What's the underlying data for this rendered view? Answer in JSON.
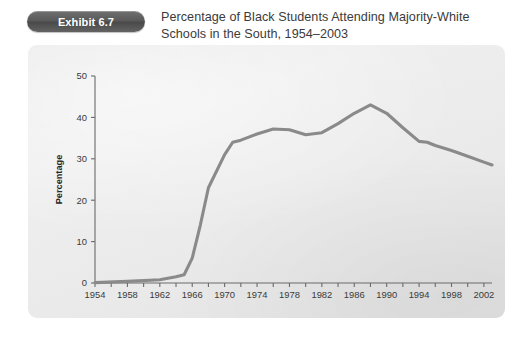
{
  "exhibit": {
    "badge_label": "Exhibit 6.7",
    "title_line1": "Percentage of Black Students Attending Majority-White",
    "title_line2": "Schools in the South, 1954–2003"
  },
  "colors": {
    "badge_bg": "#5a5a5a",
    "badge_text": "#ffffff",
    "panel_bg": "#e9e9e9",
    "line": "#8a8a8a",
    "axis": "#6a6a6a",
    "title_text": "#3b3b3b",
    "tick_text": "#3a3a3a",
    "page_bg": "#ffffff"
  },
  "chart_data": {
    "type": "line",
    "title": "Percentage of Black Students Attending Majority-White Schools in the South, 1954–2003",
    "xlabel": "",
    "ylabel": "Percentage",
    "xlim": [
      1954,
      2003
    ],
    "ylim": [
      0,
      50
    ],
    "grid": false,
    "legend": null,
    "ytick_labels": [
      "0",
      "10",
      "20",
      "30",
      "40",
      "50"
    ],
    "ytick_values": [
      0,
      10,
      20,
      30,
      40,
      50
    ],
    "xtick_labels": [
      "1954",
      "1958",
      "1962",
      "1966",
      "1970",
      "1974",
      "1978",
      "1982",
      "1986",
      "1990",
      "1994",
      "1998",
      "2002"
    ],
    "xtick_values": [
      1954,
      1958,
      1962,
      1966,
      1970,
      1974,
      1978,
      1982,
      1986,
      1990,
      1994,
      1998,
      2002
    ],
    "xminor_step": 2,
    "series": [
      {
        "name": "Percentage of Black students in majority-white schools",
        "color": "#8a8a8a",
        "x": [
          1954,
          1958,
          1962,
          1964,
          1965,
          1966,
          1967,
          1968,
          1970,
          1971,
          1972,
          1974,
          1976,
          1978,
          1980,
          1982,
          1984,
          1986,
          1988,
          1990,
          1992,
          1994,
          1995,
          1996,
          1998,
          2000,
          2002,
          2003
        ],
        "y": [
          0.1,
          0.4,
          0.8,
          1.5,
          2.0,
          6.0,
          14.0,
          23.0,
          31.0,
          34.0,
          34.5,
          36.0,
          37.2,
          37.0,
          35.8,
          36.3,
          38.5,
          41.0,
          43.0,
          41.0,
          37.5,
          34.2,
          34.0,
          33.2,
          32.0,
          30.6,
          29.2,
          28.5
        ]
      }
    ],
    "annotations": []
  },
  "geometry": {
    "plot_left": 95,
    "plot_right": 492,
    "plot_top": 76,
    "plot_bottom": 283
  }
}
